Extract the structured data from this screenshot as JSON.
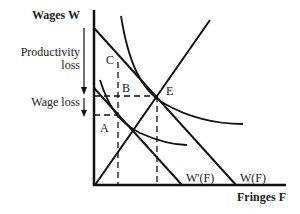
{
  "axes": {
    "y_label": "Wages W",
    "x_label": "Fringes F"
  },
  "annotations": {
    "productivity_loss_line1": "Productivity",
    "productivity_loss_line2": "loss",
    "wage_loss": "Wage loss"
  },
  "points": {
    "A": "A",
    "B": "B",
    "C": "C",
    "E": "E"
  },
  "curves": {
    "w_prime": "W'(F)",
    "w": "W(F)"
  },
  "colors": {
    "line": "#111111",
    "background": "#ffffff"
  }
}
